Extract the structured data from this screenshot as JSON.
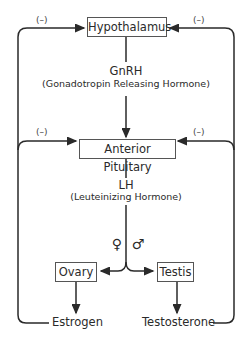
{
  "nodes": {
    "hypothalamus": "Hypothalamus",
    "anterior_pituitary": "Anterior Pituitary",
    "ovary": "Ovary",
    "testis": "Testis",
    "estrogen": "Estrogen",
    "testosterone": "Testosterone"
  },
  "hormones": {
    "gnrh": {
      "abbr": "GnRH",
      "full": "(Gonadotropin Releasing Hormone)"
    },
    "lh": {
      "abbr": "LH",
      "full": "(Leuteinizing Hormone)"
    }
  },
  "feedback": {
    "hypothalamus_left": "(–)",
    "hypothalamus_right": "(–)",
    "pituitary_left": "(–)",
    "pituitary_right": "(–)"
  },
  "sex_symbols": {
    "female": "♀",
    "male": "♂"
  },
  "colors": {
    "line": "#2a2a2a",
    "box_border": "#555555"
  }
}
